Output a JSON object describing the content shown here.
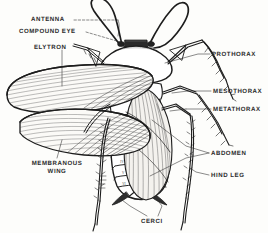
{
  "figure": {
    "style": "black and white line engraving, dorsal view",
    "ink_color": "#1d1d1d",
    "paper_color": "#fdfdfb"
  },
  "labels": {
    "antenna": "ANTENNA",
    "compound_eye": "COMPOUND EYE",
    "elytron": "ELYTRON",
    "membranous_wing_line1": "MEMBRANOUS",
    "membranous_wing_line2": "WING",
    "prothorax": "PROTHORAX",
    "mesothorax": "MESOTHORAX",
    "metathorax": "METATHORAX",
    "abdomen": "ABDOMEN",
    "hind_leg": "HIND LEG",
    "cerci": "CERCI"
  },
  "abdomen_segments": [
    "I",
    "II",
    "III",
    "IV",
    "V",
    "VI",
    "VII"
  ]
}
